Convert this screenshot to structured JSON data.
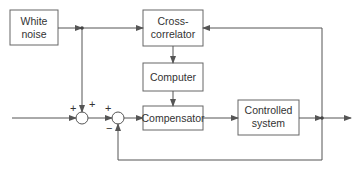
{
  "diagram": {
    "type": "block-diagram",
    "colors": {
      "line": "#555555",
      "text": "#333333",
      "background": "#ffffff"
    },
    "blocks": {
      "white_noise": {
        "line1": "White",
        "line2": "noise"
      },
      "cross_correlator": {
        "line1": "Cross-",
        "line2": "correlator"
      },
      "computer": {
        "label": "Computer"
      },
      "compensator": {
        "label": "Compensator"
      },
      "controlled_system": {
        "line1": "Controlled",
        "line2": "system"
      }
    },
    "junctions": {
      "sum1": {
        "sign_left": "+",
        "sign_top": "+"
      },
      "sum2": {
        "sign_left": "+",
        "sign_bottom": "−"
      }
    },
    "connections": [
      "white noise -> branch point -> cross-correlator",
      "branch point -> summing junction 1 (+)",
      "input -> summing junction 1 (+)",
      "summing junction 1 -> summing junction 2 (+)",
      "summing junction 2 -> compensator",
      "cross-correlator -> computer",
      "computer -> compensator",
      "compensator -> controlled system",
      "controlled system -> output branch point -> output",
      "output branch point -> cross-correlator (feedback)",
      "output branch point -> summing junction 2 (−) (feedback)"
    ]
  }
}
